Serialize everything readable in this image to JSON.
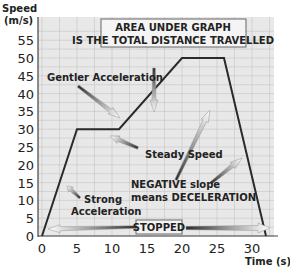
{
  "chart_data": {
    "type": "line",
    "title": "",
    "xlabel": "Time (s)",
    "ylabel": "Speed (m/s)",
    "ylabel_lines": [
      "Speed",
      "(m/s)"
    ],
    "xlim": [
      0,
      33
    ],
    "ylim": [
      0,
      58
    ],
    "x_ticks": [
      0,
      5,
      10,
      15,
      20,
      25,
      30
    ],
    "y_ticks": [
      0,
      5,
      10,
      15,
      20,
      25,
      30,
      35,
      40,
      45,
      50,
      55
    ],
    "grid": true,
    "series": [
      {
        "name": "Speed-time graph",
        "x": [
          0,
          5,
          11,
          20,
          26,
          32
        ],
        "y": [
          0,
          30,
          30,
          50,
          50,
          0
        ]
      }
    ],
    "annotations": [
      {
        "id": "area",
        "text_lines": [
          "AREA UNDER GRAPH",
          "IS THE TOTAL DISTANCE TRAVELLED"
        ],
        "boxed": true
      },
      {
        "id": "gentler",
        "text": "Gentler Acceleration"
      },
      {
        "id": "steady",
        "text": "Steady Speed"
      },
      {
        "id": "negative",
        "text_lines": [
          "NEGATIVE slope",
          "means DECELERATION"
        ]
      },
      {
        "id": "strong",
        "text_lines": [
          "Strong",
          "Acceleration"
        ]
      },
      {
        "id": "stopped",
        "text": "STOPPED",
        "boxed": true
      }
    ]
  },
  "colors": {
    "plot_bg": "#e8e8e8",
    "grid": "#c4c4c4",
    "line": "#2a2a2a",
    "text": "#222222"
  }
}
